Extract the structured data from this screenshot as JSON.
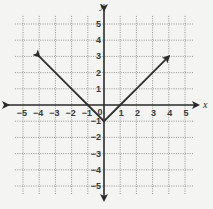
{
  "chart_data": {
    "type": "line",
    "title": "",
    "function": "y = |x| - 1",
    "xlabel": "x",
    "ylabel": "y",
    "xlim": [
      -5,
      5
    ],
    "ylim": [
      -5,
      5
    ],
    "grid": true,
    "x_ticks": [
      "-5",
      "-4",
      "-3",
      "-2",
      "-1",
      "0",
      "1",
      "2",
      "3",
      "4",
      "5"
    ],
    "y_ticks": [
      "5",
      "4",
      "3",
      "2",
      "1",
      "-1",
      "-2",
      "-3",
      "-4",
      "-5"
    ],
    "series": [
      {
        "name": "absolute value graph",
        "x": [
          -4,
          -3,
          -2,
          -1,
          0,
          1,
          2,
          3,
          4
        ],
        "y": [
          3,
          2,
          1,
          0,
          -1,
          0,
          1,
          2,
          3
        ],
        "arrows_at_ends": true
      }
    ],
    "vertex": [
      0,
      -1
    ],
    "legend": null
  },
  "labels": {
    "x_axis": "x",
    "y_axis": "y",
    "origin": "0",
    "x_neg": [
      "−5",
      "−4",
      "−3",
      "−2",
      "−1"
    ],
    "x_pos": [
      "1",
      "2",
      "3",
      "4",
      "5"
    ],
    "y_pos": [
      "1",
      "2",
      "3",
      "4",
      "5"
    ],
    "y_neg": [
      "−1",
      "−2",
      "−3",
      "−4",
      "−5"
    ]
  }
}
